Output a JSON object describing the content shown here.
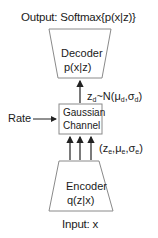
{
  "output_label": "Output: Softmax{p(x|z)}",
  "decoder": {
    "title": "Decoder",
    "formula": "p(x|z)"
  },
  "gaussian_channel": {
    "line1": "Gaussian",
    "line2": "Channel"
  },
  "decoder_sample": {
    "prefix": "z",
    "sub1": "d",
    "mid": "~N(μ",
    "sub2": "d",
    "comma": ",σ",
    "sub3": "d",
    "end": ")"
  },
  "encoder_params": {
    "open": "(z",
    "sub1": "e",
    "c1": ",μ",
    "sub2": "e",
    "c2": ",σ",
    "sub3": "e",
    "end": ")"
  },
  "rate_label": "Rate",
  "encoder": {
    "title": "Encoder",
    "formula": "q(z|x)"
  },
  "input_label": "Input: x",
  "colors": {
    "stroke": "#8a8a8a",
    "arrow": "#222222",
    "text": "#1a1a1a"
  }
}
